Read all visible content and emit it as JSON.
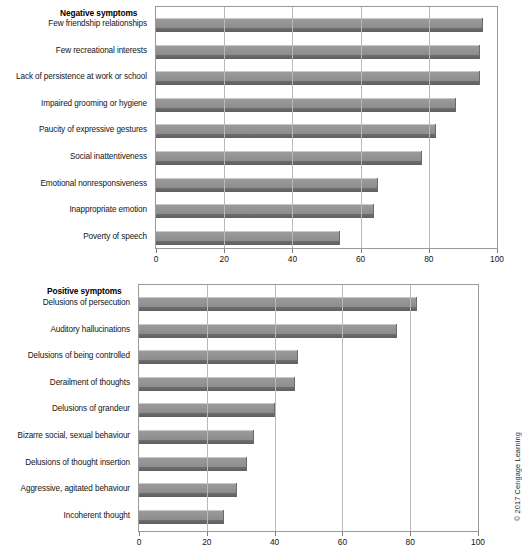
{
  "figure": {
    "copyright": "© 2017 Cengage Learning"
  },
  "chart_data": [
    {
      "id": "negative",
      "type": "bar",
      "orientation": "horizontal",
      "title": "Negative symptoms",
      "xlabel": "",
      "ylabel": "",
      "xlim": [
        0,
        100
      ],
      "xticks": [
        0,
        20,
        40,
        60,
        80,
        100
      ],
      "xtick_labels": [
        "0",
        "20",
        "40",
        "60",
        "80",
        "100"
      ],
      "grid": true,
      "legend": false,
      "bar_color": "#8c8c8c",
      "categories": [
        "Few friendship relationships",
        "Few recreational interests",
        "Lack of persistence at work or school",
        "Impaired grooming or hygiene",
        "Paucity of expressive gestures",
        "Social inattentiveness",
        "Emotional nonresponsiveness",
        "Inappropriate emotion",
        "Poverty of speech"
      ],
      "values": [
        96,
        95,
        95,
        88,
        82,
        78,
        65,
        64,
        54
      ]
    },
    {
      "id": "positive",
      "type": "bar",
      "orientation": "horizontal",
      "title": "Positive symptoms",
      "xlabel": "",
      "ylabel": "",
      "xlim": [
        0,
        100
      ],
      "xticks": [
        0,
        20,
        40,
        60,
        80,
        100
      ],
      "xtick_labels": [
        "0",
        "20",
        "40",
        "60",
        "80",
        "100"
      ],
      "grid": true,
      "legend": false,
      "bar_color": "#8c8c8c",
      "categories": [
        "Delusions of persecution",
        "Auditory hallucinations",
        "Delusions of being controlled",
        "Derailment of thoughts",
        "Delusions of grandeur",
        "Bizarre social, sexual behaviour",
        "Delusions of thought insertion",
        "Aggressive, agitated behaviour",
        "Incoherent thought"
      ],
      "values": [
        82,
        76,
        47,
        46,
        40,
        34,
        32,
        29,
        25
      ]
    }
  ]
}
